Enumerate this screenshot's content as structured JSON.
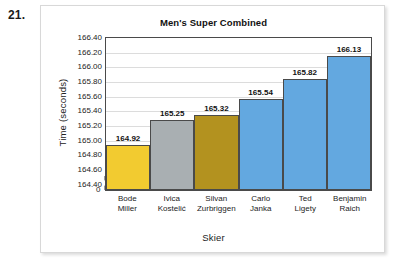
{
  "problem_number": "21.",
  "chart_data": {
    "type": "bar",
    "title": "Men's Super Combined",
    "xlabel": "Skier",
    "ylabel": "Time (seconds)",
    "categories": [
      "Bode\nMiller",
      "Ivica\nKostelić",
      "Silvan\nZurbriggen",
      "Carlo\nJanka",
      "Ted\nLigety",
      "Benjamin\nRaich"
    ],
    "category_lines": [
      [
        "Bode",
        "Miller"
      ],
      [
        "Ivica",
        "Kostelić"
      ],
      [
        "Silvan",
        "Zurbriggen"
      ],
      [
        "Carlo",
        "Janka"
      ],
      [
        "Ted",
        "Ligety"
      ],
      [
        "Benjamin",
        "Raich"
      ]
    ],
    "values": [
      164.92,
      165.25,
      165.32,
      165.54,
      165.82,
      166.13
    ],
    "value_labels": [
      "164.92",
      "165.25",
      "165.32",
      "165.54",
      "165.82",
      "166.13"
    ],
    "bar_colors": [
      "#F2CB30",
      "#A9AFB2",
      "#B3921F",
      "#63A8E0",
      "#63A8E0",
      "#63A8E0"
    ],
    "bar_border_color": "#4a4a4a",
    "ylim": [
      164.3,
      166.4
    ],
    "ytick_values": [
      164.4,
      164.6,
      164.8,
      165.0,
      165.2,
      165.4,
      165.6,
      165.8,
      166.0,
      166.2,
      166.4
    ],
    "ytick_labels": [
      "164.40",
      "164.60",
      "164.80",
      "165.00",
      "165.20",
      "165.40",
      "165.60",
      "165.80",
      "166.00",
      "166.20",
      "166.40"
    ],
    "zero_tick_label": "0",
    "axis_break": true,
    "grid": true,
    "legend": "none",
    "gridline_color": "#dcdcdc",
    "axis_color": "#4a4a4a"
  }
}
